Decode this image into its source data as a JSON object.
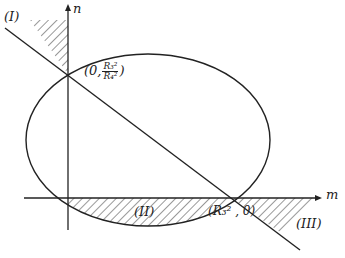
{
  "diagram": {
    "axes": {
      "x_label": "m",
      "y_label": "n"
    },
    "points": {
      "y_intercept": {
        "prefix": "(0,",
        "num": "R₃²",
        "den": "R₄²",
        "suffix": ")"
      },
      "x_intercept": "(R₃² , 0)"
    },
    "regions": [
      "(I)",
      "(II)",
      "(III)"
    ],
    "colors": {
      "stroke": "#222222",
      "background": "#ffffff"
    }
  }
}
